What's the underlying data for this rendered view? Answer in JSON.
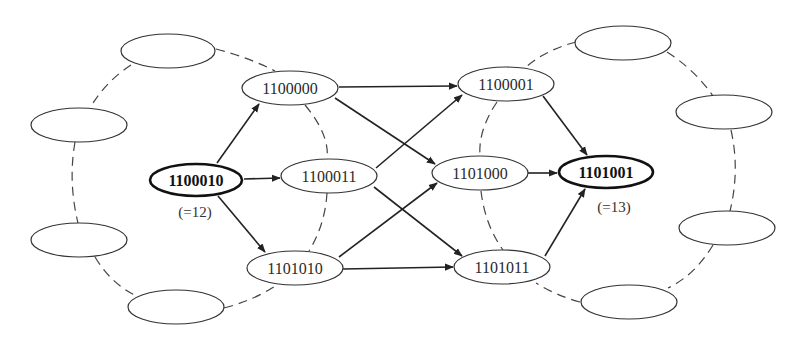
{
  "diagram": {
    "type": "directed graph (hypercube shortest paths)",
    "source": {
      "id": "1100010",
      "label": "1100010",
      "note": "(=12)"
    },
    "target": {
      "id": "1101001",
      "label": "1101001",
      "note": "(=13)"
    },
    "nodes": [
      {
        "id": "1100000",
        "label": "1100000",
        "cx": 290,
        "cy": 88,
        "bold": false
      },
      {
        "id": "1100010",
        "label": "1100010",
        "cx": 196,
        "cy": 180,
        "bold": true
      },
      {
        "id": "1100011",
        "label": "1100011",
        "cx": 329,
        "cy": 176,
        "bold": false
      },
      {
        "id": "1101010",
        "label": "1101010",
        "cx": 295,
        "cy": 268,
        "bold": false
      },
      {
        "id": "1100001",
        "label": "1100001",
        "cx": 506,
        "cy": 84,
        "bold": false
      },
      {
        "id": "1101000",
        "label": "1101000",
        "cx": 480,
        "cy": 173,
        "bold": false
      },
      {
        "id": "1101001",
        "label": "1101001",
        "cx": 606,
        "cy": 172,
        "bold": true
      },
      {
        "id": "1101011",
        "label": "1101011",
        "cx": 502,
        "cy": 267,
        "bold": false
      }
    ],
    "empty_nodes": [
      {
        "id": "L1",
        "cx": 168,
        "cy": 51
      },
      {
        "id": "L2",
        "cx": 79,
        "cy": 125
      },
      {
        "id": "L3",
        "cx": 79,
        "cy": 240
      },
      {
        "id": "L4",
        "cx": 176,
        "cy": 307
      },
      {
        "id": "R1",
        "cx": 623,
        "cy": 43
      },
      {
        "id": "R2",
        "cx": 724,
        "cy": 112
      },
      {
        "id": "R3",
        "cx": 727,
        "cy": 228
      },
      {
        "id": "R4",
        "cx": 629,
        "cy": 302
      }
    ],
    "edges": [
      {
        "from": "1100010",
        "to": "1100000"
      },
      {
        "from": "1100010",
        "to": "1100011"
      },
      {
        "from": "1100010",
        "to": "1101010"
      },
      {
        "from": "1100000",
        "to": "1100001"
      },
      {
        "from": "1100000",
        "to": "1101000"
      },
      {
        "from": "1100011",
        "to": "1100001"
      },
      {
        "from": "1100011",
        "to": "1101011"
      },
      {
        "from": "1101010",
        "to": "1101000"
      },
      {
        "from": "1101010",
        "to": "1101011"
      },
      {
        "from": "1100001",
        "to": "1101001"
      },
      {
        "from": "1101000",
        "to": "1101001"
      },
      {
        "from": "1101011",
        "to": "1101001"
      }
    ],
    "dashed_rings": [
      "left ring through 1100000, 1100011, 1101010 and 4 empty nodes",
      "right ring through 1100001, 1101000, 1101011 and 4 empty nodes"
    ]
  }
}
